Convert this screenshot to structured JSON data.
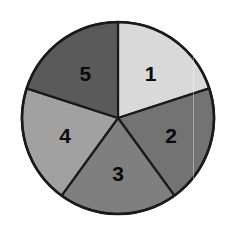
{
  "figure": {
    "kind": "spinner-pie",
    "background_color": "#ffffff",
    "width": 234,
    "height": 232,
    "outline_color": "#1a1a1a",
    "outline_width": 2.6,
    "center_x": 118,
    "center_y": 118,
    "radius": 96,
    "label_radius_fraction": 0.58,
    "artifact_line_x": 193
  },
  "chart_data": {
    "type": "pie",
    "title": "",
    "subtitle": "",
    "xlabel": "",
    "ylabel": "",
    "legend": false,
    "grid": false,
    "start_angle_deg": 90,
    "direction": "clockwise",
    "equal_slices": true,
    "categories": [
      "1",
      "2",
      "3",
      "4",
      "5"
    ],
    "values": [
      20,
      20,
      20,
      20,
      20
    ],
    "value_unit": "percent",
    "slice_angles_deg": [
      72,
      72,
      72,
      72,
      72
    ],
    "colors": [
      "#d9d9d9",
      "#737373",
      "#7f7f7f",
      "#a1a1a1",
      "#5a5a5a"
    ],
    "labels": [
      "1",
      "2",
      "3",
      "4",
      "5"
    ],
    "label_color": "#0a0a0a",
    "slices": [
      {
        "label": "1",
        "value": 20,
        "color": "#d9d9d9",
        "start_deg": 90,
        "end_deg": 18,
        "label_angle_deg": 54
      },
      {
        "label": "2",
        "value": 20,
        "color": "#737373",
        "start_deg": 18,
        "end_deg": -54,
        "label_angle_deg": -18
      },
      {
        "label": "3",
        "value": 20,
        "color": "#7f7f7f",
        "start_deg": -54,
        "end_deg": -126,
        "label_angle_deg": -90
      },
      {
        "label": "4",
        "value": 20,
        "color": "#a1a1a1",
        "start_deg": -126,
        "end_deg": -198,
        "label_angle_deg": -162
      },
      {
        "label": "5",
        "value": 20,
        "color": "#5a5a5a",
        "start_deg": -198,
        "end_deg": -270,
        "label_angle_deg": -234
      }
    ]
  }
}
